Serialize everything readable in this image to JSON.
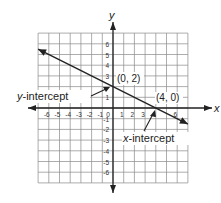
{
  "chart_data": {
    "type": "line",
    "title": "",
    "xlabel": "x",
    "ylabel": "y",
    "xlim": [
      -7,
      7
    ],
    "ylim": [
      -7,
      7
    ],
    "grid": true,
    "x_ticks": [
      -6,
      -5,
      -4,
      -3,
      -2,
      -1,
      0,
      1,
      2,
      3,
      4,
      6
    ],
    "y_ticks": [
      6,
      5,
      4,
      3,
      1,
      -1,
      -2,
      -3,
      -4,
      -5,
      -6
    ],
    "series": [
      {
        "name": "line",
        "equation": "y = -0.5x + 2",
        "points": [
          {
            "x": -7,
            "y": 5.5
          },
          {
            "x": 7,
            "y": -1.5
          }
        ],
        "arrows": "both"
      }
    ],
    "annotations": [
      {
        "text": "(0, 2)",
        "x": 0,
        "y": 2
      },
      {
        "text": "(4, 0)",
        "x": 4,
        "y": 0
      },
      {
        "text": "y-intercept",
        "points_to": {
          "x": 0,
          "y": 2
        }
      },
      {
        "text": "x-intercept",
        "points_to": {
          "x": 4,
          "y": 0
        }
      }
    ]
  },
  "labels": {
    "x_axis": "x",
    "y_axis": "y",
    "point_y_int": "(0, 2)",
    "point_x_int": "(4, 0)",
    "y_intercept_italic": "y",
    "y_intercept_rest": "-intercept",
    "x_intercept_italic": "x",
    "x_intercept_rest": "-intercept"
  }
}
